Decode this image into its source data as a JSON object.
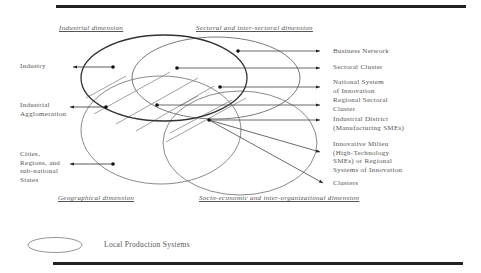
{
  "dimensions": {
    "industrial": "Industrial dimension",
    "sectoral": "Sectoral and inter-sectoral dimension",
    "geographical": "Geographical dimension",
    "socio_economic": "Socio-economic and inter-organizational dimension"
  },
  "left_labels": {
    "industry": "Industry",
    "industrial_agglomeration_1": "Industrial",
    "industrial_agglomeration_2": "Agglomeration",
    "cities_1": "Cities,",
    "cities_2": "Regions, and",
    "cities_3": "sub-national",
    "cities_4": "States"
  },
  "right_labels": {
    "business_network": "Business Network",
    "sectoral_cluster": "Sectoral Cluster",
    "national_system_1": "National System",
    "national_system_2": "of Innovation",
    "regional_sectoral_1": "Regional Sectoral",
    "regional_sectoral_2": "Cluster",
    "industrial_district_1": "Industrial District",
    "industrial_district_2": "(Manufacturing SMEs)",
    "innovative_milieu_1": "Innovative Milieu",
    "innovative_milieu_2": "(High-Technology",
    "innovative_milieu_3": "SMEs) or Regional",
    "innovative_milieu_4": "Systems of Innovation",
    "clusters": "Clusters"
  },
  "legend": {
    "label": "Local Production Systems"
  },
  "colors": {
    "rule": "#222222",
    "industrial_ellipse": "#333333",
    "other_ellipses": "#8a8a8a",
    "text": "#555555"
  }
}
